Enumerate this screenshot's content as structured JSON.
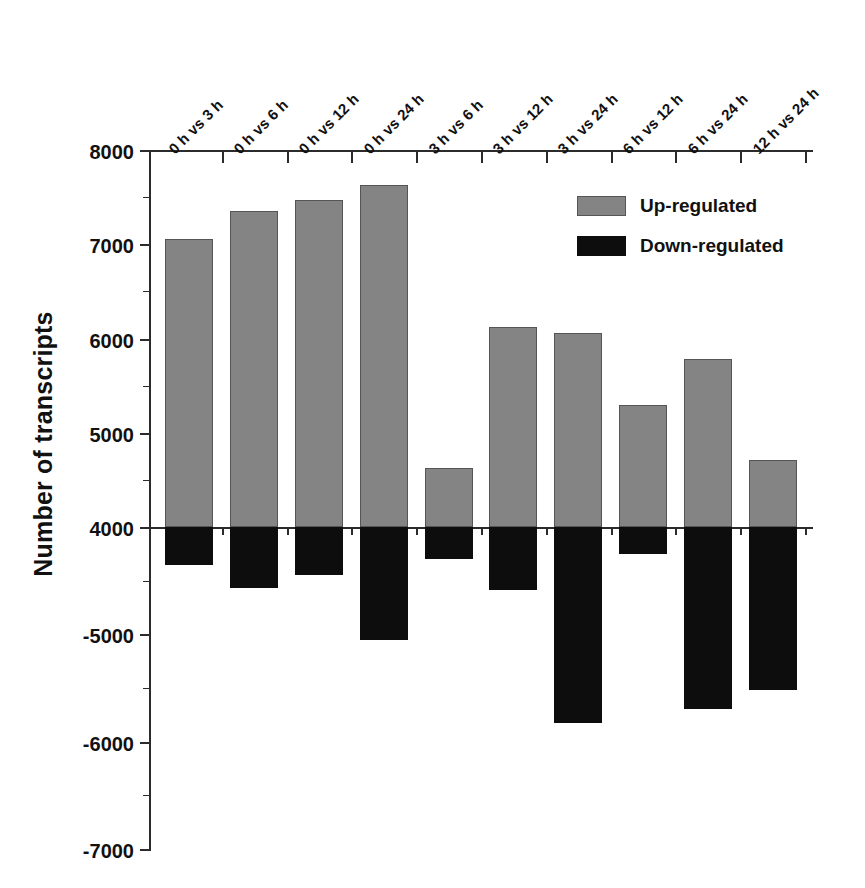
{
  "chart_data": {
    "type": "bar",
    "title": "",
    "xlabel": "",
    "ylabel": "Number of transcripts",
    "categories": [
      "0 h vs 3 h",
      "0 h vs 6 h",
      "0 h vs 12 h",
      "0 h vs 24 h",
      "3 h vs 6 h",
      "3 h vs 12 h",
      "3 h vs 24 h",
      "6 h vs 12 h",
      "6 h vs 24 h",
      "12 h vs 24 h"
    ],
    "series": [
      {
        "name": "Up-regulated",
        "color": "#848484",
        "values": [
          7060,
          7350,
          7470,
          7630,
          4630,
          6120,
          6060,
          5290,
          5780,
          4710
        ]
      },
      {
        "name": "Down-regulated",
        "color": "#0d0d0d",
        "values": [
          -4350,
          -4570,
          -4450,
          -5050,
          -4300,
          -4590,
          -5830,
          -4250,
          -5700,
          -5520
        ]
      }
    ],
    "y_axis": {
      "broken": true,
      "upper_ticks": [
        8000,
        7000,
        6000,
        5000,
        4000
      ],
      "lower_ticks": [
        -5000,
        -6000,
        -7000
      ],
      "tick_labels": [
        "8000",
        "7000",
        "6000",
        "5000",
        "4000",
        "-5000",
        "-6000",
        "-7000"
      ],
      "minor_ticks_between": true,
      "upper_range": [
        4000,
        8000
      ],
      "lower_range": [
        -7000,
        -4000
      ]
    },
    "grid": false,
    "legend": {
      "position": "top-right",
      "entries": [
        {
          "label": "Up-regulated",
          "swatch": "#848484"
        },
        {
          "label": "Down-regulated",
          "swatch": "#0d0d0d"
        }
      ]
    }
  },
  "axis": {
    "y_title": "Number of transcripts",
    "ticks": {
      "t8000": "8000",
      "t7000": "7000",
      "t6000": "6000",
      "t5000": "5000",
      "t4000": "4000",
      "tm5000": "-5000",
      "tm6000": "-6000",
      "tm7000": "-7000"
    }
  },
  "legend": {
    "up_label": "Up-regulated",
    "down_label": "Down-regulated"
  },
  "categories": {
    "c0": "0 h vs 3 h",
    "c1": "0 h vs 6 h",
    "c2": "0 h vs 12 h",
    "c3": "0 h vs 24 h",
    "c4": "3 h vs 6 h",
    "c5": "3 h vs 12 h",
    "c6": "3 h vs 24 h",
    "c7": "6 h vs 12 h",
    "c8": "6 h vs 24 h",
    "c9": "12 h vs 24 h"
  }
}
